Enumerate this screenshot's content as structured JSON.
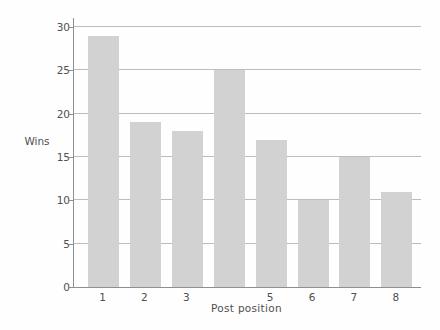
{
  "chart_data": {
    "type": "bar",
    "title": "",
    "xlabel": "Post position",
    "ylabel": "Wins",
    "categories": [
      "1",
      "2",
      "3",
      "4",
      "5",
      "6",
      "7",
      "8"
    ],
    "x_tick_labels": [
      "1",
      "2",
      "3",
      "",
      "5",
      "6",
      "7",
      "8"
    ],
    "values": [
      29,
      19,
      18,
      25,
      17,
      10,
      15,
      11
    ],
    "ylim": [
      0,
      30
    ],
    "yticks": [
      0,
      5,
      10,
      15,
      20,
      25,
      30
    ],
    "grid": true,
    "legend_position": "none",
    "bar_color": "#d2d2d2",
    "gridline_color": "#bdbdbd",
    "axis_color": "#8f8f8f",
    "text_color": "#4f4f4f",
    "background_color": "#fefefe"
  }
}
